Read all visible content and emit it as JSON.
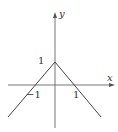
{
  "figure": {
    "axes": {
      "x_label": "x",
      "y_label": "y"
    },
    "tick_labels": {
      "y_one": "1",
      "x_neg_one": "−1",
      "x_one": "1"
    },
    "colors": {
      "axis": "#555555",
      "line": "#444444",
      "text": "#333333"
    }
  }
}
